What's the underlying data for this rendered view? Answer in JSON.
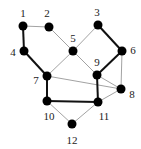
{
  "diagram": {
    "type": "graph",
    "colors": {
      "node": "#000000",
      "edge_thin": "#8a8a8a",
      "edge_thick": "#111111",
      "label": "#222222",
      "background": "#ffffff"
    },
    "nodes": [
      {
        "id": "1",
        "label": "1",
        "x": 23,
        "y": 26,
        "lx": 23,
        "ly": 17
      },
      {
        "id": "2",
        "label": "2",
        "x": 49,
        "y": 27,
        "lx": 47,
        "ly": 17
      },
      {
        "id": "3",
        "label": "3",
        "x": 98,
        "y": 25,
        "lx": 97,
        "ly": 16
      },
      {
        "id": "4",
        "label": "4",
        "x": 24,
        "y": 51,
        "lx": 13,
        "ly": 56
      },
      {
        "id": "5",
        "label": "5",
        "x": 73,
        "y": 51,
        "lx": 73,
        "ly": 42
      },
      {
        "id": "6",
        "label": "6",
        "x": 122,
        "y": 51,
        "lx": 133,
        "ly": 54
      },
      {
        "id": "7",
        "label": "7",
        "x": 47,
        "y": 76,
        "lx": 36,
        "ly": 84
      },
      {
        "id": "8",
        "label": "8",
        "x": 121,
        "y": 89,
        "lx": 132,
        "ly": 98
      },
      {
        "id": "9",
        "label": "9",
        "x": 97,
        "y": 75,
        "lx": 97,
        "ly": 66
      },
      {
        "id": "10",
        "label": "10",
        "x": 47,
        "y": 101,
        "lx": 49,
        "ly": 120
      },
      {
        "id": "11",
        "label": "11",
        "x": 98,
        "y": 102,
        "lx": 104,
        "ly": 120
      },
      {
        "id": "12",
        "label": "12",
        "x": 72,
        "y": 124,
        "lx": 72,
        "ly": 144
      }
    ],
    "edges": [
      {
        "from": "1",
        "to": "2",
        "weight": "thin"
      },
      {
        "from": "1",
        "to": "4",
        "weight": "thick"
      },
      {
        "from": "4",
        "to": "7",
        "weight": "thick"
      },
      {
        "from": "2",
        "to": "5",
        "weight": "thin"
      },
      {
        "from": "3",
        "to": "5",
        "weight": "thin"
      },
      {
        "from": "3",
        "to": "6",
        "weight": "thick"
      },
      {
        "from": "5",
        "to": "7",
        "weight": "thin"
      },
      {
        "from": "5",
        "to": "9",
        "weight": "thin"
      },
      {
        "from": "6",
        "to": "9",
        "weight": "thick"
      },
      {
        "from": "6",
        "to": "8",
        "weight": "thin"
      },
      {
        "from": "7",
        "to": "8",
        "weight": "thin"
      },
      {
        "from": "7",
        "to": "10",
        "weight": "thick"
      },
      {
        "from": "9",
        "to": "8",
        "weight": "thin"
      },
      {
        "from": "9",
        "to": "11",
        "weight": "thick"
      },
      {
        "from": "8",
        "to": "11",
        "weight": "thin"
      },
      {
        "from": "10",
        "to": "11",
        "weight": "thick"
      },
      {
        "from": "10",
        "to": "12",
        "weight": "thin"
      },
      {
        "from": "11",
        "to": "12",
        "weight": "thin"
      }
    ]
  }
}
